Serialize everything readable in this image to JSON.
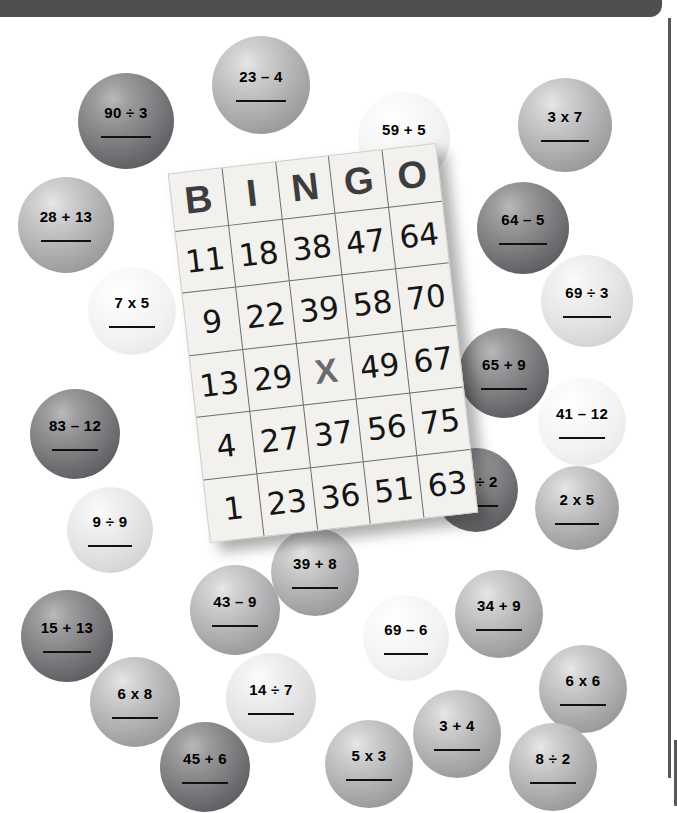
{
  "page": {
    "type": "math-bingo-worksheet",
    "background_color": "#ffffff",
    "top_bar_color": "#4f4f52",
    "rule_color": "#575759"
  },
  "bingo_card": {
    "header": [
      "B",
      "I",
      "N",
      "G",
      "O"
    ],
    "free_space_label": "X",
    "rows": [
      [
        "11",
        "18",
        "38",
        "47",
        "64"
      ],
      [
        "9",
        "22",
        "39",
        "58",
        "70"
      ],
      [
        "13",
        "29",
        "X",
        "49",
        "67"
      ],
      [
        "4",
        "27",
        "37",
        "56",
        "75"
      ],
      [
        "1",
        "23",
        "36",
        "51",
        "63"
      ]
    ]
  },
  "balls": [
    {
      "label": "90 ÷ 3",
      "tone": "tone-dark",
      "x": 78,
      "y": 73,
      "size": 96,
      "font": 15
    },
    {
      "label": "23 – 4",
      "tone": "tone-mid",
      "x": 212,
      "y": 36,
      "size": 98,
      "font": 15
    },
    {
      "label": "59 + 5",
      "tone": "tone-pale",
      "x": 358,
      "y": 92,
      "size": 92,
      "font": 15
    },
    {
      "label": "3 x 7",
      "tone": "tone-mid",
      "x": 518,
      "y": 78,
      "size": 94,
      "font": 15
    },
    {
      "label": "28 + 13",
      "tone": "tone-mid",
      "x": 18,
      "y": 177,
      "size": 96,
      "font": 15
    },
    {
      "label": "7 x 5",
      "tone": "tone-pale",
      "x": 88,
      "y": 267,
      "size": 88,
      "font": 15
    },
    {
      "label": "64 – 5",
      "tone": "tone-dark",
      "x": 477,
      "y": 182,
      "size": 92,
      "font": 15
    },
    {
      "label": "69 ÷ 3",
      "tone": "tone-light",
      "x": 541,
      "y": 255,
      "size": 92,
      "font": 15
    },
    {
      "label": "83 – 12",
      "tone": "tone-dark",
      "x": 30,
      "y": 389,
      "size": 90,
      "font": 15
    },
    {
      "label": "65 + 9",
      "tone": "tone-dark",
      "x": 459,
      "y": 328,
      "size": 90,
      "font": 15
    },
    {
      "label": "41 – 12",
      "tone": "tone-pale",
      "x": 538,
      "y": 378,
      "size": 88,
      "font": 15
    },
    {
      "label": "9 ÷ 9",
      "tone": "tone-light",
      "x": 67,
      "y": 487,
      "size": 86,
      "font": 15
    },
    {
      "label": "26 ÷ 2",
      "tone": "tone-dark",
      "x": 434,
      "y": 448,
      "size": 84,
      "font": 15
    },
    {
      "label": "2 x 5",
      "tone": "tone-mid",
      "x": 535,
      "y": 466,
      "size": 84,
      "font": 15
    },
    {
      "label": "39 + 8",
      "tone": "tone-mid",
      "x": 271,
      "y": 528,
      "size": 88,
      "font": 15
    },
    {
      "label": "43 – 9",
      "tone": "tone-mid",
      "x": 190,
      "y": 565,
      "size": 90,
      "font": 15
    },
    {
      "label": "34 + 9",
      "tone": "tone-mid",
      "x": 455,
      "y": 570,
      "size": 88,
      "font": 15
    },
    {
      "label": "15 + 13",
      "tone": "tone-dark",
      "x": 21,
      "y": 590,
      "size": 92,
      "font": 15
    },
    {
      "label": "69 – 6",
      "tone": "tone-pale",
      "x": 363,
      "y": 595,
      "size": 86,
      "font": 15
    },
    {
      "label": "14 ÷ 7",
      "tone": "tone-light",
      "x": 226,
      "y": 653,
      "size": 90,
      "font": 15
    },
    {
      "label": "6 x 8",
      "tone": "tone-mid",
      "x": 90,
      "y": 657,
      "size": 90,
      "font": 15
    },
    {
      "label": "6 x 6",
      "tone": "tone-mid",
      "x": 539,
      "y": 645,
      "size": 88,
      "font": 15
    },
    {
      "label": "45 + 6",
      "tone": "tone-dark",
      "x": 160,
      "y": 722,
      "size": 90,
      "font": 15
    },
    {
      "label": "3 + 4",
      "tone": "tone-mid",
      "x": 413,
      "y": 690,
      "size": 88,
      "font": 15
    },
    {
      "label": "5 x 3",
      "tone": "tone-mid",
      "x": 325,
      "y": 720,
      "size": 88,
      "font": 15
    },
    {
      "label": "8 ÷ 2",
      "tone": "tone-mid",
      "x": 509,
      "y": 723,
      "size": 88,
      "font": 15
    }
  ]
}
